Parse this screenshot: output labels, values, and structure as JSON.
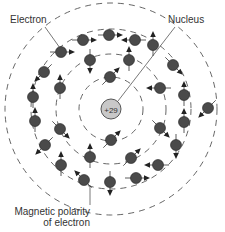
{
  "labels": {
    "electron": "Electron",
    "nucleus": "Nucleus",
    "polarity_line1": "Magnetic polarity",
    "polarity_line2": "of electron"
  },
  "nucleus": {
    "charge": "+29",
    "fill": "#c8c8c8",
    "stroke": "#555555"
  },
  "colors": {
    "electron_fill": "#4a4a4a",
    "ring_stroke": "#555555",
    "line": "#555555"
  },
  "rings": [
    {
      "shell": 1,
      "radius": 32
    },
    {
      "shell": 2,
      "radius": 55
    },
    {
      "shell": 3,
      "radius": 80
    },
    {
      "shell": 4,
      "radius": 106
    }
  ],
  "electrons": [
    {
      "x": 110,
      "y": 77,
      "arrow": "up-right"
    },
    {
      "x": 111,
      "y": 140,
      "arrow": "up-right"
    },
    {
      "x": 83,
      "y": 40,
      "arrow": "right"
    },
    {
      "x": 109,
      "y": 35,
      "arrow": "right"
    },
    {
      "x": 135,
      "y": 40,
      "arrow": "left"
    },
    {
      "x": 153,
      "y": 45,
      "arrow": "up"
    },
    {
      "x": 61,
      "y": 52,
      "arrow": "right"
    },
    {
      "x": 90,
      "y": 60,
      "arrow": "down"
    },
    {
      "x": 129,
      "y": 60,
      "arrow": "up"
    },
    {
      "x": 173,
      "y": 65,
      "arrow": "down-right"
    },
    {
      "x": 44,
      "y": 72,
      "arrow": "down-left"
    },
    {
      "x": 60,
      "y": 88,
      "arrow": "up"
    },
    {
      "x": 160,
      "y": 88,
      "arrow": "left"
    },
    {
      "x": 184,
      "y": 95,
      "arrow": "up"
    },
    {
      "x": 33,
      "y": 97,
      "arrow": "up"
    },
    {
      "x": 208,
      "y": 108,
      "arrow": "down-left"
    },
    {
      "x": 35,
      "y": 121,
      "arrow": "up"
    },
    {
      "x": 60,
      "y": 129,
      "arrow": "down-right"
    },
    {
      "x": 160,
      "y": 128,
      "arrow": "down-right"
    },
    {
      "x": 184,
      "y": 122,
      "arrow": "up"
    },
    {
      "x": 45,
      "y": 145,
      "arrow": "down-left"
    },
    {
      "x": 176,
      "y": 145,
      "arrow": "down"
    },
    {
      "x": 131,
      "y": 158,
      "arrow": "up-right"
    },
    {
      "x": 90,
      "y": 157,
      "arrow": "up"
    },
    {
      "x": 61,
      "y": 165,
      "arrow": "up"
    },
    {
      "x": 158,
      "y": 165,
      "arrow": "left"
    },
    {
      "x": 84,
      "y": 180,
      "arrow": "up-left"
    },
    {
      "x": 110,
      "y": 182,
      "arrow": "down"
    },
    {
      "x": 136,
      "y": 178,
      "arrow": "right"
    }
  ]
}
